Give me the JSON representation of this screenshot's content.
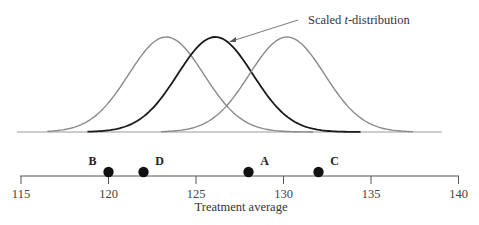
{
  "chart_data": {
    "type": "line",
    "title": "",
    "xlabel": "Treatment average",
    "ylabel": "",
    "xlim": [
      115,
      140
    ],
    "x_ticks": [
      115,
      120,
      125,
      130,
      135,
      140
    ],
    "x_tick_labels": [
      "115",
      "120",
      "125",
      "130",
      "135",
      "140"
    ],
    "grid": false,
    "legend": null,
    "annotation": {
      "text_prefix": "Scaled ",
      "text_italic": "t",
      "text_suffix": "-distribution",
      "points_to": "center (black) curve"
    },
    "curves": [
      {
        "name": "reference distribution (left)",
        "center": 123.3,
        "color": "#8a8a8a",
        "x_range": [
          116.5,
          131.7
        ]
      },
      {
        "name": "Scaled t-distribution",
        "center": 126.1,
        "color": "#1a1a1a",
        "x_range": [
          118.8,
          134.4
        ]
      },
      {
        "name": "reference distribution (right)",
        "center": 130.2,
        "color": "#8a8a8a",
        "x_range": [
          123.0,
          137.4
        ]
      }
    ],
    "points": [
      {
        "label": "B",
        "x": 120
      },
      {
        "label": "D",
        "x": 122
      },
      {
        "label": "A",
        "x": 128
      },
      {
        "label": "C",
        "x": 132
      }
    ]
  }
}
